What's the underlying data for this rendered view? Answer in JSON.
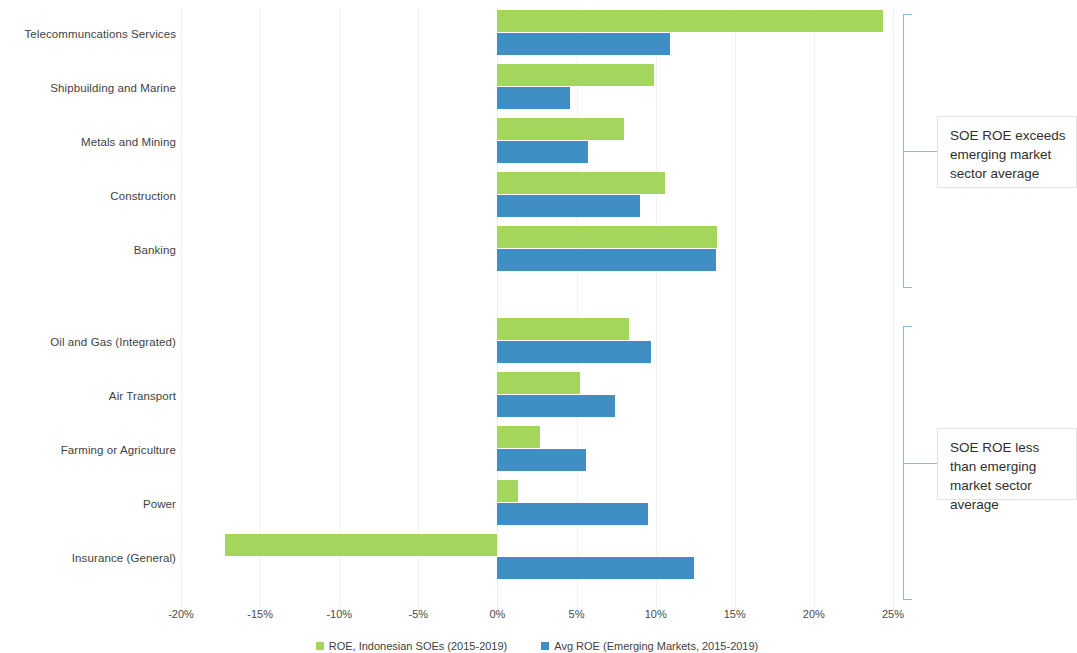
{
  "chart_data": {
    "type": "bar",
    "orientation": "horizontal",
    "title": "",
    "xlabel": "",
    "ylabel": "",
    "xlim": [
      -20,
      25
    ],
    "xtick_labels": [
      "-20%",
      "-15%",
      "-10%",
      "-5%",
      "0%",
      "5%",
      "10%",
      "15%",
      "20%",
      "25%"
    ],
    "xticks": [
      -20,
      -15,
      -10,
      -5,
      0,
      5,
      10,
      15,
      20,
      25
    ],
    "grid": true,
    "legend_position": "bottom",
    "categories": [
      "Telecommuncations Services",
      "Shipbuilding and Marine",
      "Metals and Mining",
      "Construction",
      "Banking",
      "Oil and Gas (Integrated)",
      "Air Transport",
      "Farming or Agriculture",
      "Power",
      "Insurance (General)"
    ],
    "series": [
      {
        "name": "ROE, Indonesian SOEs (2015-2019)",
        "color": "#a4d65e",
        "values": [
          24.4,
          9.9,
          8.0,
          10.6,
          13.9,
          8.3,
          5.2,
          2.7,
          1.3,
          -17.2
        ]
      },
      {
        "name": "Avg ROE (Emerging Markets, 2015-2019)",
        "color": "#3f8fc4",
        "values": [
          10.9,
          4.6,
          5.7,
          9.0,
          13.8,
          9.7,
          7.4,
          5.6,
          9.5,
          12.4
        ]
      }
    ],
    "annotations": [
      {
        "id": "above-average",
        "text": "SOE ROE exceeds emerging market sector average",
        "covers_categories": [
          "Telecommuncations Services",
          "Shipbuilding and Marine",
          "Metals and Mining",
          "Construction",
          "Banking"
        ]
      },
      {
        "id": "below-average",
        "text": "SOE ROE less than emerging market sector average",
        "covers_categories": [
          "Oil and Gas (Integrated)",
          "Air Transport",
          "Farming or Agriculture",
          "Power",
          "Insurance (General)"
        ]
      }
    ]
  }
}
